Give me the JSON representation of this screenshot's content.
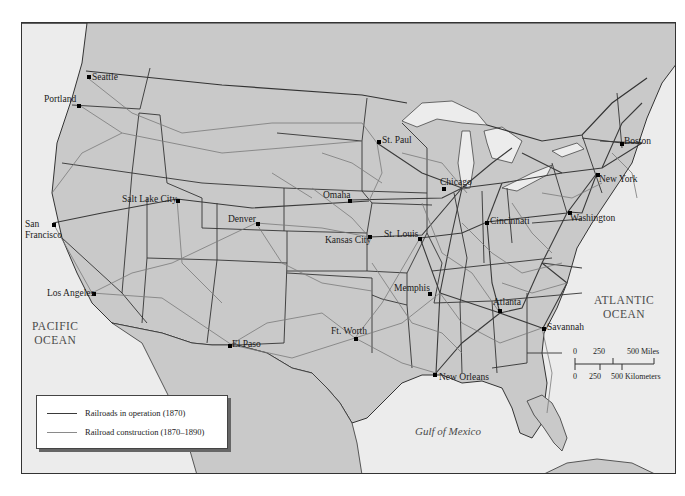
{
  "map": {
    "title": "",
    "colors": {
      "land": "#c9c9c9",
      "water": "#ececec",
      "border": "#333333",
      "railroad_1870": "#3a3a3a",
      "railroad_1870_1890": "#7a7a7a"
    },
    "oceans": {
      "pacific": "PACIFIC OCEAN",
      "pacific_line1": "PACIFIC",
      "pacific_line2": "OCEAN",
      "atlantic_line1": "ATLANTIC",
      "atlantic_line2": "OCEAN",
      "gulf": "Gulf of Mexico"
    },
    "cities": [
      {
        "name": "Seattle",
        "x": 88,
        "y": 76
      },
      {
        "name": "Portland",
        "x": 78,
        "y": 104
      },
      {
        "name": "San Francisco",
        "label_line1": "San",
        "label_line2": "Francisco",
        "x": 52,
        "y": 223
      },
      {
        "name": "Los Angeles",
        "x": 92,
        "y": 292
      },
      {
        "name": "Salt Lake City",
        "x": 176,
        "y": 200
      },
      {
        "name": "Denver",
        "x": 256,
        "y": 222
      },
      {
        "name": "El Paso",
        "x": 229,
        "y": 344
      },
      {
        "name": "Omaha",
        "x": 348,
        "y": 199
      },
      {
        "name": "Kansas City",
        "x": 368,
        "y": 234
      },
      {
        "name": "St. Louis",
        "x": 418,
        "y": 237
      },
      {
        "name": "St. Paul",
        "x": 377,
        "y": 140
      },
      {
        "name": "Chicago",
        "x": 442,
        "y": 187
      },
      {
        "name": "Cincinnati",
        "x": 485,
        "y": 221
      },
      {
        "name": "Memphis",
        "x": 428,
        "y": 292
      },
      {
        "name": "Ft. Worth",
        "x": 354,
        "y": 337
      },
      {
        "name": "New Orleans",
        "x": 433,
        "y": 372
      },
      {
        "name": "Atlanta",
        "x": 498,
        "y": 309
      },
      {
        "name": "Savannah",
        "x": 542,
        "y": 327
      },
      {
        "name": "Washington",
        "x": 568,
        "y": 211
      },
      {
        "name": "New York",
        "x": 596,
        "y": 173
      },
      {
        "name": "Boston",
        "x": 620,
        "y": 142
      }
    ],
    "legend": {
      "items": [
        {
          "label": "Railroads in operation (1870)",
          "style": "dark"
        },
        {
          "label": "Railroad construction (1870–1890)",
          "style": "light"
        }
      ]
    },
    "scale": {
      "miles_ticks": [
        "0",
        "250",
        "500 Miles"
      ],
      "km_ticks": [
        "0",
        "250",
        "500 Kilometers"
      ]
    }
  }
}
